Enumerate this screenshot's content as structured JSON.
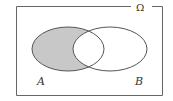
{
  "diagram": {
    "type": "venn",
    "universe_label": "Ω",
    "sets": [
      {
        "name": "A",
        "label": "A"
      },
      {
        "name": "B",
        "label": "B"
      }
    ],
    "shaded_region": "A minus B",
    "colors": {
      "shade": "#c8c8c8",
      "stroke": "#555555",
      "background": "#ffffff"
    }
  }
}
